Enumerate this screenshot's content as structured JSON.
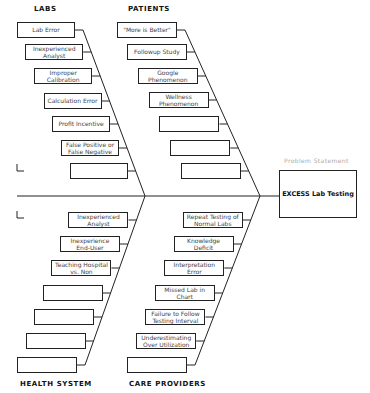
{
  "diagram": {
    "type": "fishbone",
    "problem": {
      "label": "Problem Statement",
      "text": "EXCESS Lab Testing"
    },
    "categories": {
      "labs": {
        "title": "LABS",
        "causes": [
          "Lab Error",
          "Inexperienced Analyst",
          "Improper Calibration",
          "Calculation Error",
          "Profit Incentive",
          "False Positive or False Negative",
          ""
        ]
      },
      "patients": {
        "title": "PATIENTS",
        "causes": [
          "\"More is Better\"",
          "Followup Study",
          "Google Phenomenon",
          "Wellness Phenomenon",
          "",
          "",
          ""
        ]
      },
      "health_system": {
        "title": "HEALTH SYSTEM",
        "causes": [
          "Inexperienced Analyst",
          "Inexperience End-User",
          "Teaching Hospital vs. Non",
          "",
          "",
          "",
          ""
        ]
      },
      "care_providers": {
        "title": "CARE PROVIDERS",
        "causes": [
          "Repeat Testing of Normal Labs",
          "Knowledge Deficit",
          "Interpretation Error",
          "Missed Lab in Chart",
          "Failure to Follow Testing Interval",
          "Underestimating Over Utilization",
          ""
        ]
      }
    }
  }
}
